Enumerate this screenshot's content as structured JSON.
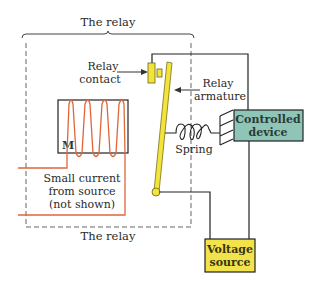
{
  "diagram": {
    "title_top": "The relay",
    "title_bottom": "The relay",
    "labels": {
      "relay_contact_line1": "Relay",
      "relay_contact_line2": "contact",
      "relay_armature_line1": "Relay",
      "relay_armature_line2": "armature",
      "spring": "Spring",
      "electromagnet_marker": "M",
      "source_note_line1": "Small current",
      "source_note_line2": "from source",
      "source_note_line3": "(not shown)"
    },
    "components": {
      "controlled_device_line1": "Controlled",
      "controlled_device_line2": "device",
      "voltage_source_line1": "Voltage",
      "voltage_source_line2": "source"
    },
    "colors": {
      "coil_wire": "#e0663a",
      "contact_yellow": "#f2e43a",
      "device_teal": "#8ec5b6",
      "source_yellow": "#f2e24c",
      "wire": "#222222",
      "dashed_border": "#666666"
    }
  }
}
